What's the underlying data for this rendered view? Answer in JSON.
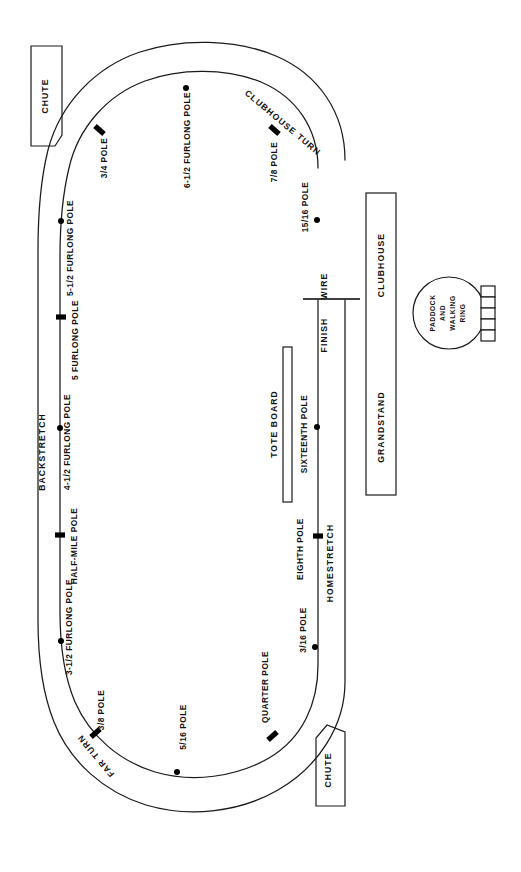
{
  "diagram": {
    "orientation": "rotated-90",
    "background_color": "#ffffff",
    "line_color": "#1a1a1a"
  },
  "track": {
    "sections": [
      {
        "id": "backstretch",
        "label": "BACKSTRETCH"
      },
      {
        "id": "homestretch",
        "label": "HOMESTRETCH"
      },
      {
        "id": "clubhouse-turn",
        "label": "CLUBHOUSE TURN"
      },
      {
        "id": "far-turn",
        "label": "FAR TURN"
      }
    ]
  },
  "poles": [
    {
      "id": "three-quarter",
      "label": "3/4 POLE",
      "type": "bar"
    },
    {
      "id": "six-and-half-furlong",
      "label": "6-1/2 FURLONG POLE",
      "type": "dot"
    },
    {
      "id": "seven-eighths",
      "label": "7/8 POLE",
      "type": "bar"
    },
    {
      "id": "fifteen-sixteenths",
      "label": "15/16 POLE",
      "type": "dot"
    },
    {
      "id": "five-and-half-furlong",
      "label": "5-1/2 FURLONG POLE",
      "type": "dot"
    },
    {
      "id": "five-furlong",
      "label": "5 FURLONG POLE",
      "type": "bar"
    },
    {
      "id": "four-and-half-furlong",
      "label": "4-1/2 FURLONG POLE",
      "type": "dot"
    },
    {
      "id": "half-mile",
      "label": "HALF-MILE POLE",
      "type": "bar"
    },
    {
      "id": "three-and-half-furlong",
      "label": "3-1/2 FURLONG POLE",
      "type": "dot"
    },
    {
      "id": "three-eighths",
      "label": "3/8 POLE",
      "type": "bar"
    },
    {
      "id": "five-sixteenths",
      "label": "5/16 POLE",
      "type": "dot"
    },
    {
      "id": "quarter",
      "label": "QUARTER POLE",
      "type": "bar"
    },
    {
      "id": "three-sixteenths",
      "label": "3/16 POLE",
      "type": "dot"
    },
    {
      "id": "eighth",
      "label": "EIGHTH POLE",
      "type": "bar"
    },
    {
      "id": "sixteenth",
      "label": "SIXTEENTH POLE",
      "type": "dot"
    }
  ],
  "markers": {
    "finish": "FINISH",
    "wire": "WIRE"
  },
  "structures": {
    "chute_top": "CHUTE",
    "chute_bottom": "CHUTE",
    "tote_board": "TOTE BOARD",
    "grandstand": "GRANDSTAND",
    "clubhouse": "CLUBHOUSE",
    "paddock_line1": "PADDOCK",
    "paddock_line2": "AND",
    "paddock_line3": "WALKING",
    "paddock_line4": "RING"
  }
}
